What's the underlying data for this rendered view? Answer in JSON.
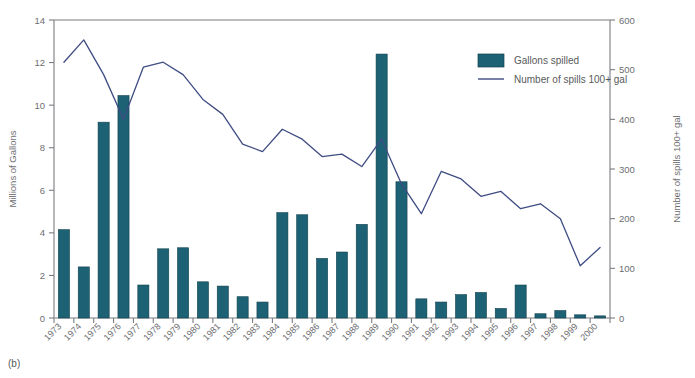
{
  "figure": {
    "panel_label": "(b)"
  },
  "legend": {
    "position": "top-right-inside",
    "items": [
      {
        "label": "Gallons spilled",
        "marker": "swatch",
        "color": "#1c6174"
      },
      {
        "label": "Number of spills 100+ gal",
        "marker": "line",
        "color": "#3e4c83"
      }
    ]
  },
  "colors": {
    "bar_fill": "#1c6174",
    "bar_stroke": "#12414e",
    "line": "#3e4c83",
    "axis": "#7a7c80",
    "text": "#6d6e71",
    "background": "#ffffff"
  },
  "chart_data": {
    "type": "bar",
    "title": "",
    "subtitle": "",
    "xlabel": "",
    "ylabel": "Millions of Gallons",
    "y2label": "Number of spills 100+ gal",
    "ylim": [
      0,
      14
    ],
    "y2lim": [
      0,
      600
    ],
    "yticks": [
      0,
      2,
      4,
      6,
      8,
      10,
      12,
      14
    ],
    "ytick_labels": [
      "0",
      "2",
      "4",
      "6",
      "8",
      "10",
      "12",
      "14"
    ],
    "y2ticks": [
      0,
      100,
      200,
      300,
      400,
      500,
      600
    ],
    "y2tick_labels": [
      "0",
      "100",
      "200",
      "300",
      "400",
      "500",
      "600"
    ],
    "grid": false,
    "categories": [
      "1973",
      "1974",
      "1975",
      "1976",
      "1977",
      "1978",
      "1979",
      "1980",
      "1981",
      "1982",
      "1983",
      "1984",
      "1985",
      "1986",
      "1987",
      "1988",
      "1989",
      "1990",
      "1991",
      "1992",
      "1993",
      "1994",
      "1995",
      "1996",
      "1997",
      "1998",
      "1999",
      "2000"
    ],
    "series": [
      {
        "name": "Gallons spilled",
        "type": "bar",
        "axis": "left",
        "units": "millions of gallons",
        "color": "#1c6174",
        "values": [
          4.15,
          2.4,
          9.2,
          10.45,
          1.55,
          3.25,
          3.3,
          1.7,
          1.5,
          1.0,
          0.75,
          4.95,
          4.85,
          2.8,
          3.1,
          4.4,
          12.4,
          6.4,
          0.9,
          0.75,
          1.1,
          1.2,
          0.45,
          1.55,
          0.2,
          0.35,
          0.15,
          0.1
        ]
      },
      {
        "name": "Number of spills 100+ gal",
        "type": "line",
        "axis": "right",
        "units": "spills",
        "color": "#3e4c83",
        "values": [
          515,
          560,
          490,
          400,
          505,
          515,
          490,
          440,
          410,
          350,
          335,
          380,
          360,
          325,
          330,
          305,
          360,
          270,
          210,
          295,
          280,
          245,
          255,
          220,
          230,
          200,
          105,
          142
        ]
      }
    ]
  }
}
